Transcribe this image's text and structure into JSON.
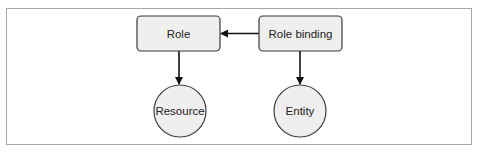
{
  "diagram": {
    "type": "rbac-relationship",
    "nodes": [
      {
        "id": "role",
        "label": "Role",
        "shape": "rounded-rect"
      },
      {
        "id": "role_binding",
        "label": "Role binding",
        "shape": "rounded-rect"
      },
      {
        "id": "resource",
        "label": "Resource",
        "shape": "circle"
      },
      {
        "id": "entity",
        "label": "Entity",
        "shape": "circle"
      }
    ],
    "edges": [
      {
        "from": "role_binding",
        "to": "role"
      },
      {
        "from": "role",
        "to": "resource"
      },
      {
        "from": "role_binding",
        "to": "entity"
      }
    ],
    "colors": {
      "node_fill": "#efefef",
      "node_stroke": "#3a3a3a",
      "edge": "#111111",
      "frame": "#a8a8a8"
    }
  }
}
